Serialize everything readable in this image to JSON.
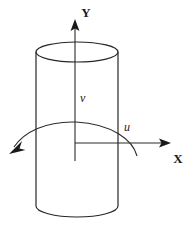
{
  "figure": {
    "type": "diagram",
    "background_color": "#ffffff",
    "stroke_color": "#262626",
    "width": 194,
    "height": 238
  },
  "axes": {
    "y": {
      "label": "Y",
      "label_x": 86,
      "label_y": 16,
      "origin": {
        "x": 75,
        "y": 143
      },
      "tip": {
        "x": 75,
        "y": 20
      },
      "direction": "up"
    },
    "x": {
      "label": "X",
      "label_x": 173,
      "label_y": 163,
      "origin": {
        "x": 75,
        "y": 143
      },
      "tip": {
        "x": 170,
        "y": 143
      },
      "direction": "right"
    }
  },
  "variables": [
    {
      "name": "v",
      "label": "v",
      "meaning": "axial-velocity",
      "label_x": 79,
      "label_y": 101
    },
    {
      "name": "u",
      "label": "u",
      "meaning": "circumferential-velocity",
      "label_x": 123,
      "label_y": 131
    }
  ],
  "cylinder": {
    "left_x": 36,
    "right_x": 118,
    "center_x": 77,
    "top_ellipse_cy": 52,
    "top_ellipse_rx": 41,
    "top_ellipse_ry": 10,
    "bottom_ellipse_cy": 216,
    "bottom_ellipse_rx": 41,
    "bottom_ellipse_ry": 10
  },
  "rotation_arrow": {
    "name": "rotation-arc",
    "start": {
      "x": 136,
      "y": 155
    },
    "apex": {
      "x": 76,
      "y": 122
    },
    "end": {
      "x": 12,
      "y": 148
    },
    "arrowhead_at": "end",
    "arrowhead_direction": "down-left"
  }
}
